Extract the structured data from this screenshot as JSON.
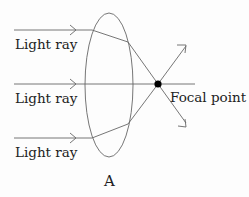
{
  "diagram": {
    "labels": {
      "ray_top": "Light ray",
      "ray_middle": "Light ray",
      "ray_bottom": "Light ray",
      "focal_point": "Focal point",
      "caption": "A"
    },
    "colors": {
      "line": "#555555",
      "focal_dot": "#000000",
      "text": "#222222"
    }
  }
}
